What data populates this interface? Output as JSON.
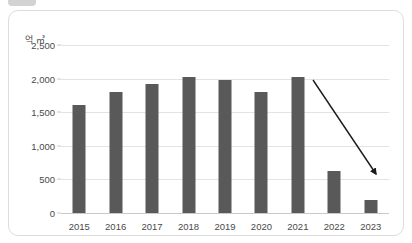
{
  "chip": {
    "name": "top-chip"
  },
  "chart_data": {
    "type": "bar",
    "title": "",
    "subtitle": "",
    "xlabel": "",
    "ylabel": "억 ㎥",
    "unit_label": "억 ㎥",
    "categories": [
      "2015",
      "2016",
      "2017",
      "2018",
      "2019",
      "2020",
      "2021",
      "2022",
      "2023"
    ],
    "values": [
      1600,
      1800,
      1920,
      2020,
      1980,
      1800,
      2030,
      620,
      200
    ],
    "series": [
      {
        "name": "",
        "values": [
          1600,
          1800,
          1920,
          2020,
          1980,
          1800,
          2030,
          620,
          200
        ]
      }
    ],
    "ylim": [
      0,
      2500
    ],
    "ytick_values": [
      0,
      500,
      1000,
      1500,
      2000,
      2500
    ],
    "ytick_labels": [
      "0",
      "500",
      "1,000",
      "1,500",
      "2,000",
      "2,500"
    ],
    "grid": true,
    "legend": false,
    "legend_position": "none",
    "bar_color": "#595959",
    "gridline_color": "#e3e3e3",
    "axis_color": "#c9c9c9",
    "text_color": "#4a4a4a",
    "annotations": [
      {
        "type": "arrow",
        "name": "declining-trend-arrow",
        "label": "",
        "color": "#1a1a1a",
        "from": {
          "x": 313,
          "y": 80
        },
        "to": {
          "x": 376,
          "y": 174
        }
      }
    ]
  }
}
